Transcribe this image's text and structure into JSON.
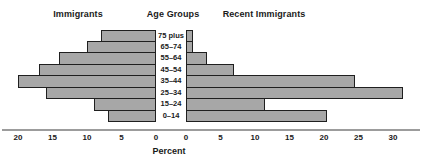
{
  "chart_data": {
    "type": "bar",
    "variant": "bidirectional-horizontal-pyramid",
    "title_left": "Immigrants",
    "title_center": "Age Groups",
    "title_right": "Recent Immigrants",
    "xlabel": "Percent",
    "age_groups": [
      "75 plus",
      "65–74",
      "55–64",
      "45–54",
      "35–44",
      "25–34",
      "15–24",
      "0–14"
    ],
    "series": [
      {
        "name": "Immigrants",
        "side": "left",
        "values": [
          8,
          10,
          14,
          17,
          20,
          16,
          9,
          7
        ]
      },
      {
        "name": "Recent Immigrants",
        "side": "right",
        "values": [
          1,
          1,
          3,
          7,
          24.5,
          31.5,
          11.5,
          20.5
        ]
      }
    ],
    "left_axis_ticks": [
      20,
      15,
      10,
      5,
      0
    ],
    "right_axis_ticks": [
      0,
      5,
      10,
      15,
      20,
      25,
      30
    ],
    "left_axis_range": [
      0,
      20
    ],
    "right_axis_range": [
      0,
      30
    ],
    "grid": false,
    "legend_position": "none",
    "colors": {
      "bar_fill": "#a7a7a7",
      "bar_border": "#1f1f1f",
      "axis_line": "#9c9c9c",
      "text": "#1a1a1a",
      "background": "#ffffff"
    }
  }
}
